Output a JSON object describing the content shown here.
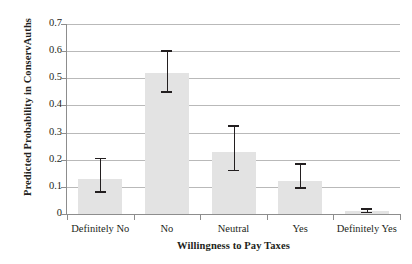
{
  "chart_data": {
    "type": "bar",
    "title": "",
    "xlabel": "Willingness to Pay Taxes",
    "ylabel": "Predicted Probability in ConservAuths",
    "categories": [
      "Definitely No",
      "No",
      "Neutral",
      "Yes",
      "Definitely Yes"
    ],
    "values": [
      0.13,
      0.52,
      0.23,
      0.12,
      0.01
    ],
    "error_low": [
      0.08,
      0.45,
      0.16,
      0.095,
      0.005
    ],
    "error_high": [
      0.205,
      0.6,
      0.325,
      0.185,
      0.018
    ],
    "ylim": [
      0,
      0.7
    ],
    "ytick_labels": [
      "0.7",
      "0.6",
      "0.5",
      "0.4",
      "0.3",
      "0.2",
      "0.1",
      "0"
    ],
    "ytick_values": [
      0.7,
      0.6,
      0.5,
      0.4,
      0.3,
      0.2,
      0.1,
      0
    ],
    "grid": true,
    "legend": "none",
    "bar_color": "#e3e3e3",
    "error_bar_color": "#231f20",
    "grid_color": "#b9b9b9",
    "axis_color": "#8d8d8d",
    "text_color": "#231f20",
    "background": "#ffffff"
  }
}
